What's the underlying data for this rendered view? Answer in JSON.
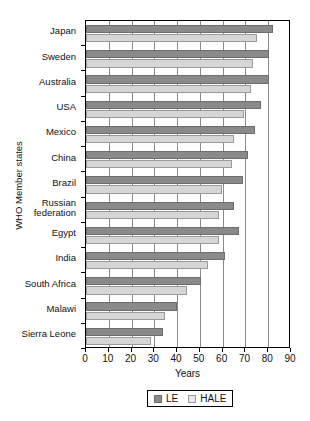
{
  "chart_data": {
    "type": "bar",
    "orientation": "horizontal",
    "title": "",
    "xlabel": "Years",
    "ylabel": "WHO Member states",
    "xlim": [
      0,
      90
    ],
    "xticks": [
      0,
      10,
      20,
      30,
      40,
      50,
      60,
      70,
      80,
      90
    ],
    "grid": true,
    "grid_axis": "x",
    "legend_position": "bottom",
    "categories": [
      "Japan",
      "Sweden",
      "Australia",
      "USA",
      "Mexico",
      "China",
      "Brazil",
      "Russian\nfederation",
      "Egypt",
      "India",
      "South Africa",
      "Malawi",
      "Sierra Leone"
    ],
    "series": [
      {
        "name": "LE",
        "color": "#8a8a8a",
        "values": [
          82,
          80.5,
          80.5,
          77,
          74,
          71,
          69,
          65,
          67,
          61,
          50.5,
          40,
          34
        ]
      },
      {
        "name": "HALE",
        "color": "#d6d6d6",
        "values": [
          75,
          73.5,
          72.5,
          69.5,
          65,
          64,
          59.5,
          58.5,
          58.5,
          53.5,
          44.5,
          34.5,
          28.5
        ]
      }
    ]
  },
  "legend": {
    "items": [
      {
        "label": "LE",
        "swatch": "le"
      },
      {
        "label": "HALE",
        "swatch": "hale"
      }
    ]
  },
  "axis": {
    "x_title": "Years",
    "y_title": "WHO Member states"
  }
}
